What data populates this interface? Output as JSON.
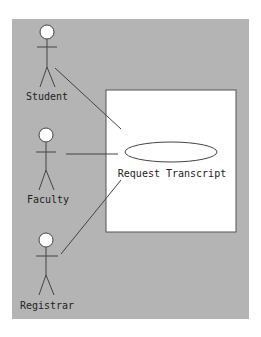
{
  "diagram": {
    "type": "use-case",
    "background_color": "#b4b4b4",
    "system_box_color": "#ffffff",
    "line_color": "#333333",
    "actors": [
      {
        "id": "student",
        "label": "Student"
      },
      {
        "id": "faculty",
        "label": "Faculty"
      },
      {
        "id": "registrar",
        "label": "Registrar"
      }
    ],
    "use_cases": [
      {
        "id": "request-transcript",
        "label": "Request Transcript"
      }
    ],
    "associations": [
      {
        "from": "student",
        "to": "request-transcript"
      },
      {
        "from": "faculty",
        "to": "request-transcript"
      },
      {
        "from": "registrar",
        "to": "request-transcript"
      }
    ]
  }
}
